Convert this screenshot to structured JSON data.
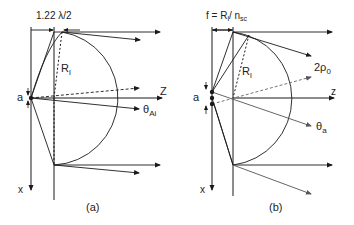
{
  "panels": [
    {
      "id": "a",
      "caption": "(a)",
      "top_dimension_label": "1.22 λ/2",
      "radius_label": "R",
      "radius_sub": "l",
      "source_size_label": "a",
      "axis_z_label": "Z",
      "axis_x_label": "x",
      "angle_label": "θ",
      "angle_sub": "Ai"
    },
    {
      "id": "b",
      "caption": "(b)",
      "top_dimension_label": "f = R",
      "top_dimension_sub": "l",
      "top_dimension_suffix": "/ n",
      "top_dimension_suffix_sub": "sc",
      "radius_label": "R",
      "radius_sub": "l",
      "source_size_label": "a",
      "axis_z_label": "z",
      "axis_x_label": "x",
      "angle_label": "θ",
      "angle_sub": "a",
      "divergence_label": "2ρ",
      "divergence_sub": "0"
    }
  ],
  "colors": {
    "line": "#1a1a1a",
    "gray_ray": "#555555",
    "background": "#ffffff"
  }
}
